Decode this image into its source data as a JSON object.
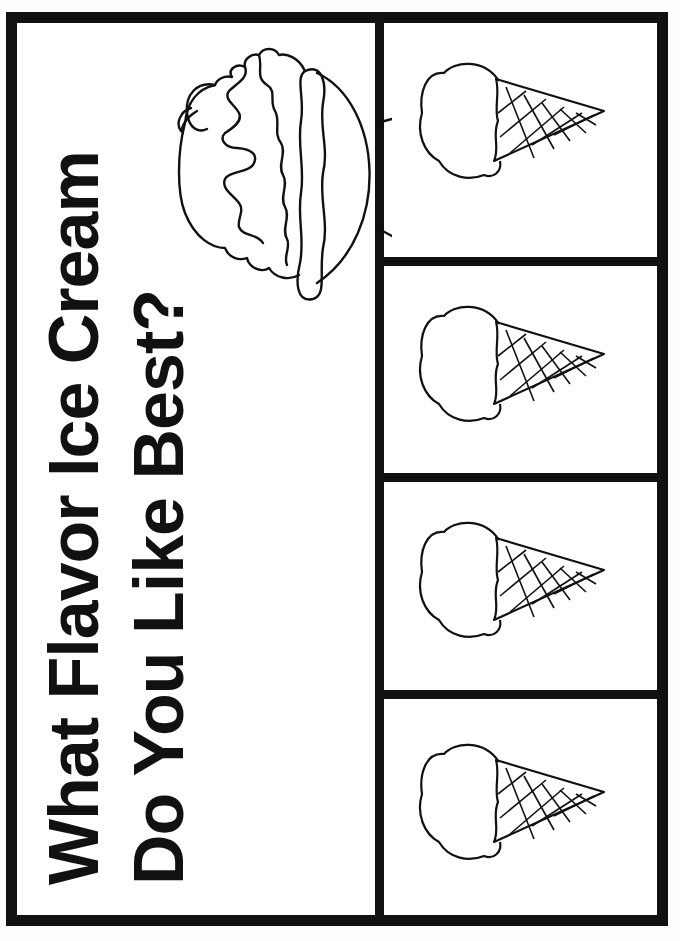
{
  "title": {
    "line1": "What Flavor Ice Cream",
    "line2": "Do You Like Best?"
  },
  "illustration": {
    "sundae": "ice-cream-sundae-with-cherry",
    "cones": [
      "ice-cream-cone",
      "ice-cream-cone",
      "ice-cream-cone",
      "ice-cream-cone"
    ]
  },
  "colors": {
    "ink": "#111111",
    "paper": "#ffffff"
  }
}
